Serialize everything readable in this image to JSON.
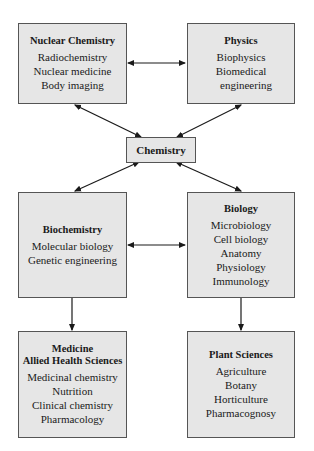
{
  "diagram": {
    "center": {
      "title": "Chemistry"
    },
    "nodes": [
      {
        "id": "nuclear",
        "title": "Nuclear Chemistry",
        "items": [
          "Radiochemistry",
          "Nuclear medicine",
          "Body imaging"
        ]
      },
      {
        "id": "physics",
        "title": "Physics",
        "items": [
          "Biophysics",
          "Biomedical",
          "engineering"
        ]
      },
      {
        "id": "biochem",
        "title": "Biochemistry",
        "items": [
          "Molecular biology",
          "Genetic engineering"
        ]
      },
      {
        "id": "biology",
        "title": "Biology",
        "items": [
          "Microbiology",
          "Cell biology",
          "Anatomy",
          "Physiology",
          "Immunology"
        ]
      },
      {
        "id": "medicine",
        "title_lines": [
          "Medicine",
          "Allied Health Sciences"
        ],
        "items": [
          "Medicinal chemistry",
          "Nutrition",
          "Clinical chemistry",
          "Pharmacology"
        ]
      },
      {
        "id": "plant",
        "title": "Plant Sciences",
        "items": [
          "Agriculture",
          "Botany",
          "Horticulture",
          "Pharmacognosy"
        ]
      }
    ],
    "connections": [
      {
        "from": "Nuclear Chemistry",
        "to": "Physics",
        "type": "bidirectional"
      },
      {
        "from": "Chemistry",
        "to": "Nuclear Chemistry",
        "type": "bidirectional"
      },
      {
        "from": "Chemistry",
        "to": "Physics",
        "type": "bidirectional"
      },
      {
        "from": "Chemistry",
        "to": "Biochemistry",
        "type": "bidirectional"
      },
      {
        "from": "Chemistry",
        "to": "Biology",
        "type": "bidirectional"
      },
      {
        "from": "Biochemistry",
        "to": "Biology",
        "type": "bidirectional"
      },
      {
        "from": "Biochemistry",
        "to": "Medicine Allied Health Sciences",
        "type": "directed"
      },
      {
        "from": "Biology",
        "to": "Plant Sciences",
        "type": "directed"
      }
    ],
    "colors": {
      "box_fill": "#e6e6e6",
      "box_border": "#555555",
      "arrow": "#1a1a1a"
    }
  }
}
